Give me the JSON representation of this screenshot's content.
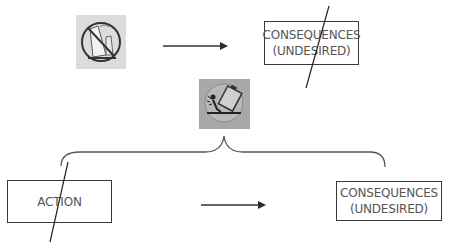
{
  "top_row": {
    "icon": {
      "name": "no-tipping-icon",
      "background": "#dcdcdc"
    },
    "arrow": "right-arrow",
    "consequence_box": {
      "line1": "CONSEQUENCES",
      "line2": "(UNDESIRED)",
      "crossed_out": true
    }
  },
  "middle": {
    "icon": {
      "name": "tipping-hazard-icon",
      "background": "#a8a8a8"
    },
    "brace": "curly-brace"
  },
  "bottom_row": {
    "action_box": {
      "label": "ACTION",
      "crossed_out": true
    },
    "arrow": "right-arrow",
    "consequence_box": {
      "line1": "CONSEQUENCES",
      "line2": "(UNDESIRED)",
      "crossed_out": false
    }
  },
  "colors": {
    "line": "#2b2b2b",
    "text": "#555555",
    "light_tile": "#dcdcdc",
    "dark_tile": "#a8a8a8"
  }
}
